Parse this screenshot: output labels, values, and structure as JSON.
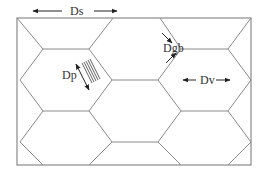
{
  "diagram": {
    "type": "hexagonal grain structure schematic",
    "colors": {
      "grain_boundary": "#8a8a8a",
      "arrow": "#222222",
      "text": "#333333",
      "background": "#ffffff"
    },
    "labels": {
      "grain_spacing": "Ds",
      "particle_diameter": "Dp",
      "grain_boundary_width": "Dgb",
      "void_diameter": "Dv"
    },
    "frame": {
      "x": 17,
      "y": 18,
      "width": 234,
      "height": 147
    },
    "grain_rows": 3,
    "annotations": [
      {
        "id": "Ds",
        "kind": "double-arrow horizontal",
        "position": "top-left above frame"
      },
      {
        "id": "Dp",
        "kind": "double-arrow diagonal with hatched lamellae",
        "position": "center-left grain boundary"
      },
      {
        "id": "Dgb",
        "kind": "opposing arrows across boundary",
        "position": "upper-center boundary"
      },
      {
        "id": "Dv",
        "kind": "double-arrow horizontal",
        "position": "right grain interior"
      }
    ]
  }
}
